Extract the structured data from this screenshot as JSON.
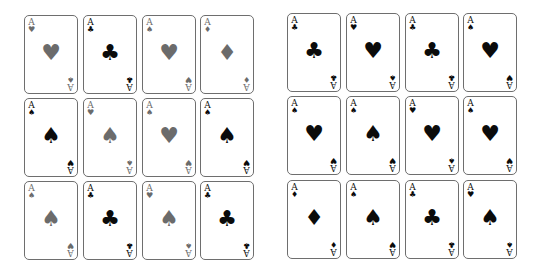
{
  "colors": {
    "grey": "#6b6b6b",
    "black": "#0b0b0b",
    "border": "#6e6e6e"
  },
  "left_grid": [
    {
      "rank": "A",
      "corner_suit": "♥",
      "corner_color": "grey",
      "bottom_suit": "♠",
      "center": "♥",
      "center_color": "grey"
    },
    {
      "rank": "A",
      "corner_suit": "♣",
      "corner_color": "black",
      "bottom_suit": "♣",
      "center": "♣",
      "center_color": "black"
    },
    {
      "rank": "A",
      "corner_suit": "♠",
      "corner_color": "grey",
      "bottom_suit": "♥",
      "center": "♥",
      "center_color": "grey"
    },
    {
      "rank": "A",
      "corner_suit": "♦",
      "corner_color": "grey",
      "bottom_suit": "♦",
      "center": "♦",
      "center_color": "grey"
    },
    {
      "rank": "A",
      "corner_suit": "♠",
      "corner_color": "black",
      "bottom_suit": "♥",
      "center": "♠",
      "center_color": "black"
    },
    {
      "rank": "A",
      "corner_suit": "♥",
      "corner_color": "grey",
      "bottom_suit": "♠",
      "center": "♠",
      "center_color": "grey"
    },
    {
      "rank": "A",
      "corner_suit": "♠",
      "corner_color": "grey",
      "bottom_suit": "♥",
      "center": "♥",
      "center_color": "grey"
    },
    {
      "rank": "A",
      "corner_suit": "♠",
      "corner_color": "black",
      "bottom_suit": "♥",
      "center": "♠",
      "center_color": "black"
    },
    {
      "rank": "A",
      "corner_suit": "♠",
      "corner_color": "grey",
      "bottom_suit": "♥",
      "center": "♠",
      "center_color": "grey"
    },
    {
      "rank": "A",
      "corner_suit": "♣",
      "corner_color": "black",
      "bottom_suit": "♣",
      "center": "♣",
      "center_color": "black"
    },
    {
      "rank": "A",
      "corner_suit": "♥",
      "corner_color": "grey",
      "bottom_suit": "♠",
      "center": "♠",
      "center_color": "grey"
    },
    {
      "rank": "A",
      "corner_suit": "♣",
      "corner_color": "black",
      "bottom_suit": "♣",
      "center": "♣",
      "center_color": "black"
    }
  ],
  "right_grid": [
    {
      "rank": "A",
      "corner_suit": "♣",
      "corner_color": "black",
      "bottom_suit": "♣",
      "center": "♣",
      "center_color": "black"
    },
    {
      "rank": "A",
      "corner_suit": "♥",
      "corner_color": "black",
      "bottom_suit": "♠",
      "center": "♥",
      "center_color": "black"
    },
    {
      "rank": "A",
      "corner_suit": "♣",
      "corner_color": "black",
      "bottom_suit": "♣",
      "center": "♣",
      "center_color": "black"
    },
    {
      "rank": "A",
      "corner_suit": "♠",
      "corner_color": "black",
      "bottom_suit": "♥",
      "center": "♥",
      "center_color": "black"
    },
    {
      "rank": "A",
      "corner_suit": "♠",
      "corner_color": "black",
      "bottom_suit": "♥",
      "center": "♥",
      "center_color": "black"
    },
    {
      "rank": "A",
      "corner_suit": "♠",
      "corner_color": "black",
      "bottom_suit": "♥",
      "center": "♠",
      "center_color": "black"
    },
    {
      "rank": "A",
      "corner_suit": "♥",
      "corner_color": "black",
      "bottom_suit": "♠",
      "center": "♥",
      "center_color": "black"
    },
    {
      "rank": "A",
      "corner_suit": "♠",
      "corner_color": "black",
      "bottom_suit": "♥",
      "center": "♥",
      "center_color": "black"
    },
    {
      "rank": "A",
      "corner_suit": "♦",
      "corner_color": "black",
      "bottom_suit": "♦",
      "center": "♦",
      "center_color": "black"
    },
    {
      "rank": "A",
      "corner_suit": "♠",
      "corner_color": "black",
      "bottom_suit": "♥",
      "center": "♠",
      "center_color": "black"
    },
    {
      "rank": "A",
      "corner_suit": "♣",
      "corner_color": "black",
      "bottom_suit": "♣",
      "center": "♣",
      "center_color": "black"
    },
    {
      "rank": "A",
      "corner_suit": "♥",
      "corner_color": "black",
      "bottom_suit": "♠",
      "center": "♠",
      "center_color": "black"
    }
  ]
}
